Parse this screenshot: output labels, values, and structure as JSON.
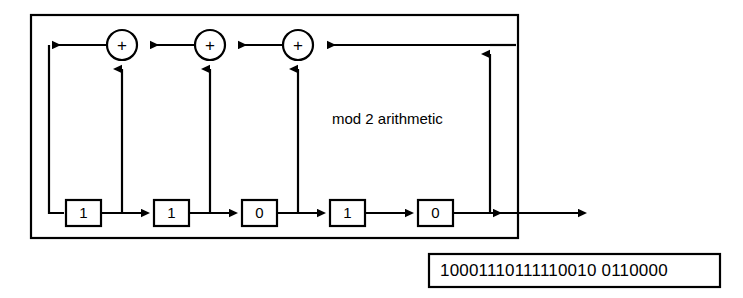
{
  "diagram": {
    "annotation": "mod 2 arithmetic",
    "line_color": "#000000",
    "background": "#ffffff",
    "registers": [
      {
        "name": "register-stage-1",
        "value": "1"
      },
      {
        "name": "register-stage-2",
        "value": "1"
      },
      {
        "name": "register-stage-3",
        "value": "0"
      },
      {
        "name": "register-stage-4",
        "value": "1"
      },
      {
        "name": "register-stage-5",
        "value": "0"
      }
    ],
    "adders": [
      {
        "name": "xor-adder-1",
        "symbol": "+"
      },
      {
        "name": "xor-adder-2",
        "symbol": "+"
      },
      {
        "name": "xor-adder-3",
        "symbol": "+"
      }
    ],
    "output": {
      "label": "output-bit-sequence",
      "bits": "10001110111110010 0110000"
    }
  }
}
